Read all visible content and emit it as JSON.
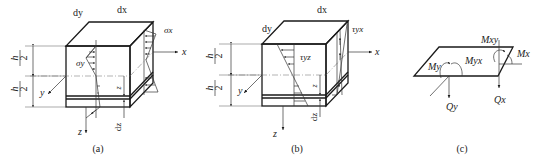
{
  "figure": {
    "panels": [
      {
        "id": "a",
        "caption": "(a)",
        "labels": {
          "dx": "dx",
          "dy": "dy",
          "h_top_num": "h",
          "h_top_den": "2",
          "h_bot_num": "h",
          "h_bot_den": "2",
          "stress_front": "σy",
          "stress_side": "σx",
          "axis_x": "x",
          "axis_y": "y",
          "axis_z": "z",
          "z_dim": "z",
          "dz": "dz"
        }
      },
      {
        "id": "b",
        "caption": "(b)",
        "labels": {
          "dx": "dx",
          "dy": "dy",
          "h_top_num": "h",
          "h_top_den": "2",
          "h_bot_num": "h",
          "h_bot_den": "2",
          "stress_front": "τyz",
          "stress_side": "τyx",
          "axis_x": "x",
          "axis_y": "y",
          "axis_z": "z",
          "z_dim": "z",
          "dz": "dz"
        }
      },
      {
        "id": "c",
        "caption": "(c)",
        "labels": {
          "Mxy": "Mxy",
          "Myx": "Myx",
          "My": "My",
          "Mx": "Mx",
          "Qy": "Qy",
          "Qx": "Qx"
        }
      }
    ]
  }
}
